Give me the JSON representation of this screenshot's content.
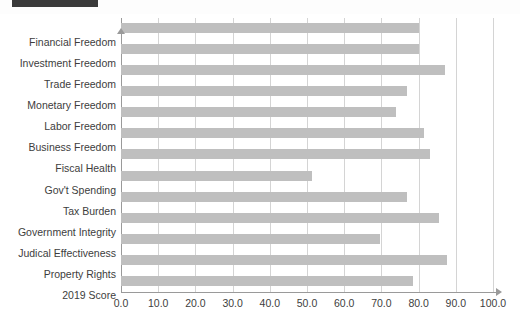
{
  "window": {
    "cropped_title_bar": "",
    "note_label": ""
  },
  "chart_data": {
    "type": "bar",
    "orientation": "horizontal",
    "title": "",
    "xlabel": "",
    "ylabel": "",
    "xlim": [
      0.0,
      100.0
    ],
    "xtick_step": 10.0,
    "grid": true,
    "legend": "none",
    "bar_color": "#bfbfbf",
    "xticklabels": [
      "0.0",
      "10.0",
      "20.0",
      "30.0",
      "40.0",
      "50.0",
      "60.0",
      "70.0",
      "80.0",
      "90.0",
      "100.0"
    ],
    "categories": [
      "Financial Freedom",
      "Investment Freedom",
      "Trade Freedom",
      "Monetary Freedom",
      "Labor Freedom",
      "Business Freedom",
      "Fiscal Health",
      "Gov't Spending",
      "Tax Burden",
      "Government Integrity",
      "Judical Effectiveness",
      "Property Rights",
      "2019 Score"
    ],
    "values": [
      80.0,
      80.0,
      87.0,
      77.0,
      74.0,
      81.5,
      83.0,
      51.3,
      77.0,
      85.5,
      69.6,
      87.6,
      78.5
    ]
  }
}
